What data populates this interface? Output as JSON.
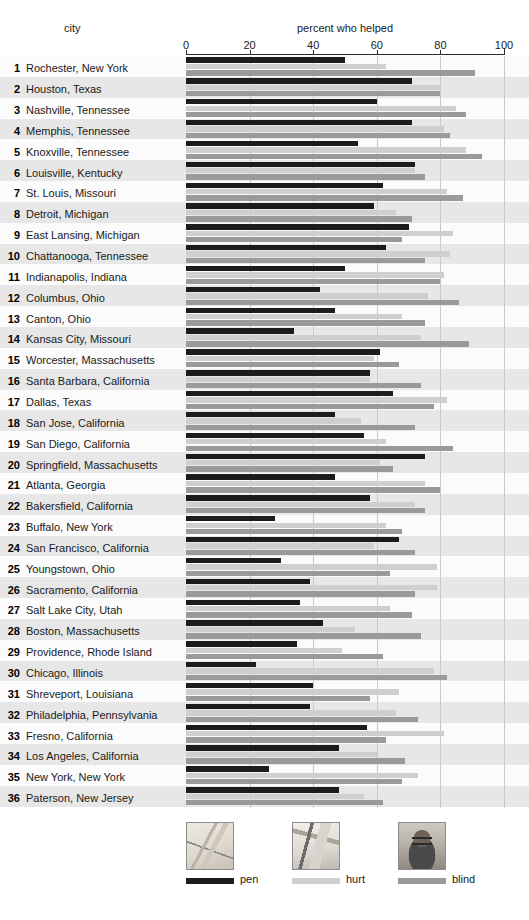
{
  "header": {
    "city_label": "city",
    "metric_label": "percent who helped"
  },
  "axis": {
    "ticks": [
      0,
      20,
      40,
      60,
      80,
      100
    ],
    "min": 0,
    "max": 100
  },
  "legend": {
    "items": [
      {
        "key": "pen",
        "label": "pen",
        "color": "#1c1c1c",
        "photo": "pen-photo"
      },
      {
        "key": "hurt",
        "label": "hurt",
        "color": "#cfcfcf",
        "photo": "hurt-photo"
      },
      {
        "key": "blind",
        "label": "blind",
        "color": "#9a9a9a",
        "photo": "blind-photo"
      }
    ]
  },
  "chart_data": {
    "type": "bar",
    "orientation": "horizontal",
    "title": "percent who helped",
    "xlabel": "percent who helped",
    "ylabel": "city",
    "xlim": [
      0,
      100
    ],
    "grid": true,
    "legend_position": "bottom",
    "categories": [
      "Rochester, New York",
      "Houston, Texas",
      "Nashville, Tennessee",
      "Memphis, Tennessee",
      "Knoxville, Tennessee",
      "Louisville, Kentucky",
      "St. Louis, Missouri",
      "Detroit, Michigan",
      "East Lansing, Michigan",
      "Chattanooga, Tennessee",
      "Indianapolis, Indiana",
      "Columbus, Ohio",
      "Canton, Ohio",
      "Kansas City, Missouri",
      "Worcester, Massachusetts",
      "Santa Barbara, California",
      "Dallas, Texas",
      "San Jose, California",
      "San Diego, California",
      "Springfield, Massachusetts",
      "Atlanta, Georgia",
      "Bakersfield, California",
      "Buffalo, New York",
      "San Francisco, California",
      "Youngstown, Ohio",
      "Sacramento, California",
      "Salt Lake City, Utah",
      "Boston, Massachusetts",
      "Providence, Rhode Island",
      "Chicago, Illinois",
      "Shreveport, Louisiana",
      "Philadelphia, Pennsylvania",
      "Fresno, California",
      "Los Angeles, California",
      "New York, New York",
      "Paterson, New Jersey"
    ],
    "ranks": [
      1,
      2,
      3,
      4,
      5,
      6,
      7,
      8,
      9,
      10,
      11,
      12,
      13,
      14,
      15,
      16,
      17,
      18,
      19,
      20,
      21,
      22,
      23,
      24,
      25,
      26,
      27,
      28,
      29,
      30,
      31,
      32,
      33,
      34,
      35,
      36
    ],
    "series": [
      {
        "name": "pen",
        "color": "#1c1c1c",
        "values": [
          50,
          71,
          60,
          71,
          54,
          72,
          62,
          59,
          70,
          63,
          50,
          42,
          47,
          34,
          61,
          58,
          65,
          47,
          56,
          75,
          47,
          58,
          28,
          67,
          30,
          39,
          36,
          43,
          35,
          22,
          40,
          39,
          57,
          48,
          26,
          48
        ]
      },
      {
        "name": "hurt",
        "color": "#cfcfcf",
        "values": [
          63,
          80,
          85,
          81,
          88,
          72,
          82,
          66,
          84,
          83,
          81,
          76,
          68,
          74,
          59,
          58,
          82,
          55,
          63,
          61,
          75,
          72,
          63,
          59,
          79,
          79,
          64,
          53,
          49,
          78,
          67,
          66,
          81,
          60,
          73,
          56
        ]
      },
      {
        "name": "blind",
        "color": "#9a9a9a",
        "values": [
          91,
          80,
          88,
          83,
          93,
          75,
          87,
          71,
          68,
          75,
          80,
          86,
          75,
          89,
          67,
          74,
          78,
          72,
          84,
          65,
          80,
          75,
          68,
          72,
          64,
          72,
          71,
          74,
          62,
          82,
          58,
          73,
          63,
          69,
          68,
          62
        ]
      }
    ]
  }
}
